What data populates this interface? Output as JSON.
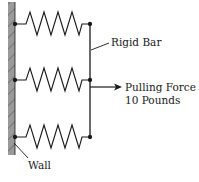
{
  "diagram": {
    "labels": {
      "rigid_bar": "Rigid Bar",
      "force_line1": "Pulling Force =",
      "force_line2": "10 Pounds",
      "wall": "Wall"
    },
    "springs": [
      {
        "name": "top-spring",
        "y": 24
      },
      {
        "name": "middle-spring",
        "y": 80
      },
      {
        "name": "bottom-spring",
        "y": 137
      }
    ],
    "colors": {
      "wall_fill": "#9a9a9a",
      "line": "#1a1a1a"
    }
  }
}
